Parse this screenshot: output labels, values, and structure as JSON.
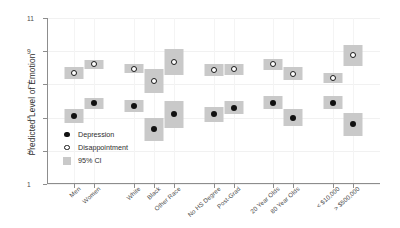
{
  "chart_data": {
    "type": "scatter",
    "title": "",
    "xlabel": "",
    "ylabel": "Predicted Level of Emotion",
    "ylim": [
      1,
      11
    ],
    "yticks": [
      1,
      3,
      5,
      7,
      9,
      11
    ],
    "grid": true,
    "legend_position": "inside-bottom-left",
    "legend": [
      {
        "key": "filled-circle",
        "label": "Depression"
      },
      {
        "key": "open-circle",
        "label": "Disappointment"
      },
      {
        "key": "gray-box",
        "label": "95% CI"
      }
    ],
    "categories": [
      "Men",
      "Women",
      "White",
      "Black",
      "Other Race",
      "No HS Degree",
      "Post-Grad",
      "20 Year Olds",
      "80 Year Olds",
      "< $10,000",
      "> $500,000"
    ],
    "group_breaks": [
      2,
      5,
      7,
      9
    ],
    "series": [
      {
        "name": "Depression",
        "marker": "filled-circle",
        "values": [
          5.1,
          5.85,
          5.7,
          4.3,
          5.2,
          5.2,
          5.6,
          5.9,
          5.0,
          5.9,
          4.6
        ],
        "ci_low": [
          4.7,
          5.5,
          5.35,
          3.6,
          4.4,
          4.75,
          5.2,
          5.5,
          4.5,
          5.5,
          3.9
        ],
        "ci_high": [
          5.5,
          6.2,
          6.05,
          5.0,
          6.0,
          5.65,
          6.0,
          6.3,
          5.5,
          6.3,
          5.3
        ]
      },
      {
        "name": "Disappointment",
        "marker": "open-circle",
        "values": [
          7.7,
          8.2,
          7.95,
          7.2,
          8.35,
          7.85,
          7.9,
          8.2,
          7.65,
          7.4,
          8.75
        ],
        "ci_low": [
          7.35,
          7.9,
          7.7,
          6.5,
          7.55,
          7.5,
          7.55,
          7.85,
          7.25,
          7.1,
          8.1
        ],
        "ci_high": [
          8.05,
          8.5,
          8.2,
          7.9,
          9.15,
          8.2,
          8.25,
          8.55,
          8.05,
          7.7,
          9.4
        ]
      }
    ],
    "colors": {
      "point_filled": "#111111",
      "point_open_edge": "#1a1a1a",
      "ci_band": "#c9c9c9",
      "axis": "#8d8d8d",
      "grid": "#f1f1f1",
      "text": "#3a3a3a"
    }
  }
}
